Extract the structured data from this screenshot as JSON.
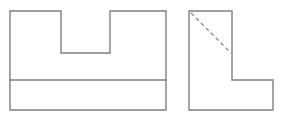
{
  "drawing": {
    "title": "Orthographic Projection - Two Views",
    "sheet": {
      "width": 285,
      "height": 119,
      "background": "#ffffff"
    },
    "style": {
      "visible_line_color": "#808080",
      "hidden_line_color": "#8a8a8a",
      "visible_line_width": 1.4,
      "hidden_line_width": 1.3,
      "hidden_line_dash": "4,3"
    },
    "views": [
      {
        "name": "front-view",
        "label": "Front View",
        "type": "outline",
        "bounds": {
          "x": 10,
          "y": 11,
          "width": 156,
          "height": 99
        },
        "outline_points": "10,11 61,11 61,53 110,53 110,11 166,11 166,110 10,110",
        "features": [
          {
            "name": "top-notch",
            "label": "Rectangular Notch",
            "x": 61,
            "y": 11,
            "width": 49,
            "height": 42
          },
          {
            "name": "base-divider-line",
            "label": "Base Divider Line",
            "x1": 10,
            "y1": 80,
            "x2": 166,
            "y2": 80
          }
        ]
      },
      {
        "name": "side-view",
        "label": "Side View",
        "type": "outline",
        "bounds": {
          "x": 189,
          "y": 11,
          "width": 84,
          "height": 99
        },
        "outline_points": "189,11 232,11 232,80 273,80 273,110 189,110",
        "features": [
          {
            "name": "hidden-diagonal-line",
            "label": "Hidden Edge",
            "x1": 191,
            "y1": 13,
            "x2": 231,
            "y2": 53
          }
        ]
      }
    ]
  }
}
